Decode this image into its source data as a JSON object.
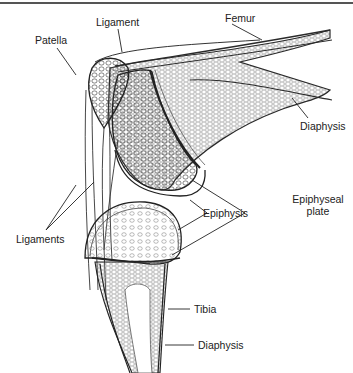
{
  "header": {
    "page_fragment": "Inflammation 151"
  },
  "diagram": {
    "labels": {
      "ligament": "Ligament",
      "femur": "Femur",
      "patella": "Patella",
      "diaphysis_femur": "Diaphysis",
      "ligaments": "Ligaments",
      "epiphysis": "Epiphysis",
      "epiphyseal_plate_line1": "Epiphyseal",
      "epiphyseal_plate_line2": "plate",
      "tibia": "Tibia",
      "diaphysis_tibia": "Diaphysis"
    },
    "colors": {
      "ink": "#2a2a2a",
      "paper": "#ffffff"
    }
  }
}
